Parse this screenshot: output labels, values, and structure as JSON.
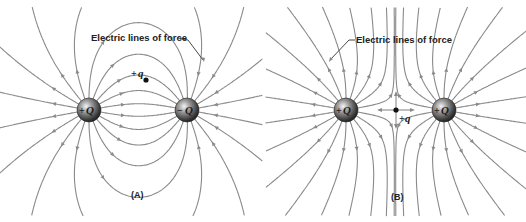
{
  "figure": {
    "panels": [
      {
        "id": "A",
        "tag": "(A)",
        "callout": "Electric lines of force",
        "charges": [
          {
            "sign": "+",
            "symbol": "Q",
            "description": "positive source charge"
          },
          {
            "sign": "−",
            "symbol": "Q",
            "description": "negative source charge"
          }
        ],
        "test_charge": {
          "sign": "+",
          "symbol": "q"
        },
        "arrangement": "unlike charges (dipole): lines run from +Q to −Q"
      },
      {
        "id": "B",
        "tag": "(B)",
        "callout": "Electric lines of force",
        "charges": [
          {
            "sign": "+",
            "symbol": "Q",
            "description": "positive source charge"
          },
          {
            "sign": "+",
            "symbol": "Q",
            "description": "positive source charge"
          }
        ],
        "test_charge": {
          "sign": "+",
          "symbol": "q"
        },
        "arrangement": "like charges: lines repel, neutral point between charges"
      }
    ]
  },
  "colors": {
    "field_line": "#8a8a8a",
    "text": "#222222",
    "background": "#ffffff"
  }
}
